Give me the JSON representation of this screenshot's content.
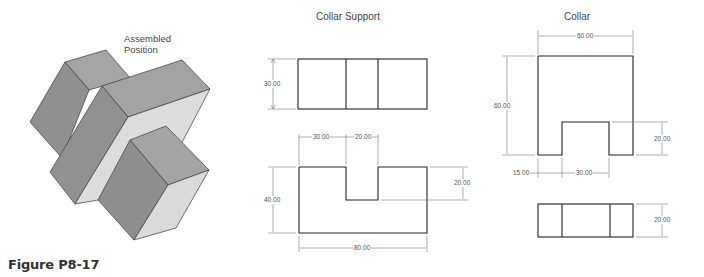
{
  "figure": {
    "caption": "Figure P8-17",
    "assembled_label_line1": "Assembled",
    "assembled_label_line2": "Position"
  },
  "collar_support": {
    "title": "Collar Support",
    "top_view": {
      "height_dim": "30.00"
    },
    "front_view": {
      "left_width_dim": "30.00",
      "slot_width_dim": "20.00",
      "slot_depth_dim": "20.00",
      "height_dim": "40.00",
      "overall_width_dim": "80.00"
    }
  },
  "collar": {
    "title": "Collar",
    "front_view": {
      "width_dim": "60.00",
      "height_dim": "60.00",
      "slot_depth_dim": "20.00",
      "left_offset_dim": "15.00",
      "slot_width_dim": "30.00"
    },
    "bottom_view": {
      "height_dim": "20.00"
    }
  },
  "colors": {
    "block_dark": "#8f8f8f",
    "block_mid": "#a3a3a3",
    "block_light": "#d9d9d9",
    "line": "#333333",
    "dim_line": "#777777"
  }
}
